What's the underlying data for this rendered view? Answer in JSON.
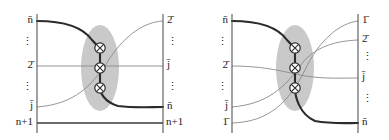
{
  "figure": {
    "width": 389,
    "height": 140,
    "background": "#ffffff",
    "line_color_thick": "#2b2b2b",
    "line_color_thin": "#8a8a8a",
    "axis_color": "#555555",
    "ellipse_fill": "#c9c9c9",
    "node_fill": "#ffffff",
    "node_stroke": "#2b2b2b"
  },
  "panels": [
    {
      "id": "left",
      "name": "left-diagram",
      "left_labels": [
        {
          "text": "n̄",
          "base": "n",
          "overline": true,
          "y": 21
        },
        {
          "text": "⋮",
          "base": "vdots",
          "overline": false,
          "y": 43
        },
        {
          "text": "2̄",
          "base": "2",
          "overline": true,
          "y": 66
        },
        {
          "text": "⋮",
          "base": "vdots",
          "overline": false,
          "y": 88
        },
        {
          "text": "j̄",
          "base": "j",
          "overline": true,
          "y": 107
        },
        {
          "text": "n+1",
          "base": "n+1",
          "overline": false,
          "y": 123
        }
      ],
      "right_labels": [
        {
          "text": "2̄",
          "base": "2",
          "overline": true,
          "y": 21
        },
        {
          "text": "⋮",
          "base": "vdots",
          "overline": false,
          "y": 43
        },
        {
          "text": "j̄",
          "base": "j",
          "overline": true,
          "y": 66
        },
        {
          "text": "⋮",
          "base": "vdots",
          "overline": false,
          "y": 88
        },
        {
          "text": "n̄",
          "base": "n",
          "overline": true,
          "y": 107
        },
        {
          "text": "n+1",
          "base": "n+1",
          "overline": false,
          "y": 123
        }
      ],
      "nodes": [
        {
          "label": "crossing-node-1",
          "cx": 100,
          "cy": 48
        },
        {
          "label": "crossing-node-2",
          "cx": 100,
          "cy": 68
        },
        {
          "label": "crossing-node-3",
          "cx": 100,
          "cy": 88
        }
      ],
      "ellipse": {
        "cx": 100,
        "cy": 68,
        "rx": 19,
        "ry": 43
      },
      "axes": {
        "x_left": 37,
        "x_right": 163,
        "y_top": 14,
        "y_bottom": 133
      }
    },
    {
      "id": "right",
      "name": "right-diagram",
      "left_labels": [
        {
          "text": "n̄",
          "base": "n",
          "overline": true,
          "y": 21
        },
        {
          "text": "⋮",
          "base": "vdots",
          "overline": false,
          "y": 43
        },
        {
          "text": "2̄",
          "base": "2",
          "overline": true,
          "y": 66
        },
        {
          "text": "⋮",
          "base": "vdots",
          "overline": false,
          "y": 88
        },
        {
          "text": "j̄",
          "base": "j",
          "overline": true,
          "y": 107
        },
        {
          "text": "1̄",
          "base": "1",
          "overline": true,
          "y": 123
        }
      ],
      "right_labels": [
        {
          "text": "1̄",
          "base": "1",
          "overline": true,
          "y": 21
        },
        {
          "text": "2̄",
          "base": "2",
          "overline": true,
          "y": 40
        },
        {
          "text": "⋮",
          "base": "vdots",
          "overline": false,
          "y": 58
        },
        {
          "text": "j̄",
          "base": "j",
          "overline": true,
          "y": 78
        },
        {
          "text": "⋮",
          "base": "vdots",
          "overline": false,
          "y": 100
        },
        {
          "text": "n̄",
          "base": "n",
          "overline": true,
          "y": 123
        }
      ],
      "nodes": [
        {
          "label": "crossing-node-1",
          "cx": 100,
          "cy": 48
        },
        {
          "label": "crossing-node-2",
          "cx": 100,
          "cy": 68
        },
        {
          "label": "crossing-node-3",
          "cx": 100,
          "cy": 88
        }
      ],
      "ellipse": {
        "cx": 100,
        "cy": 68,
        "rx": 19,
        "ry": 43
      },
      "axes": {
        "x_left": 37,
        "x_right": 163,
        "y_top": 14,
        "y_bottom": 133
      }
    }
  ]
}
